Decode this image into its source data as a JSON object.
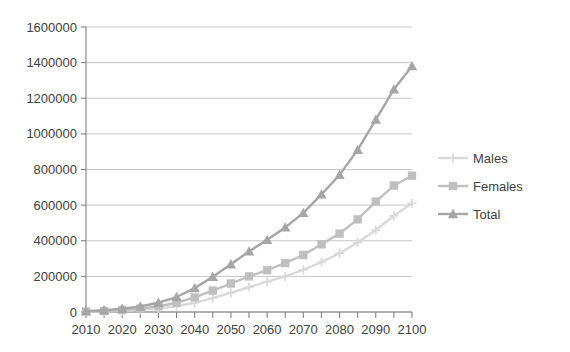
{
  "chart_data": {
    "type": "line",
    "title": "",
    "xlabel": "",
    "ylabel": "",
    "xlim": [
      2010,
      2100
    ],
    "ylim": [
      0,
      1600000
    ],
    "grid": true,
    "legend_position": "right",
    "y_ticks": [
      0,
      200000,
      400000,
      600000,
      800000,
      1000000,
      1200000,
      1400000,
      1600000
    ],
    "y_tick_labels": [
      "0",
      "200000",
      "400000",
      "600000",
      "800000",
      "1000000",
      "1200000",
      "1400000",
      "1600000"
    ],
    "x_ticks": [
      2010,
      2020,
      2030,
      2040,
      2050,
      2060,
      2070,
      2080,
      2090,
      2100
    ],
    "x_tick_labels": [
      "2010",
      "2020",
      "2030",
      "2040",
      "2050",
      "2060",
      "2070",
      "2080",
      "2090",
      "2100"
    ],
    "x_minor_ticks": [
      2015,
      2025,
      2035,
      2045,
      2055,
      2065,
      2075,
      2085,
      2095
    ],
    "x": [
      2010,
      2015,
      2020,
      2025,
      2030,
      2035,
      2040,
      2045,
      2050,
      2055,
      2060,
      2065,
      2070,
      2075,
      2080,
      2085,
      2090,
      2095,
      2100
    ],
    "series": [
      {
        "name": "Males",
        "color": "#d9d9d9",
        "marker": "cross",
        "values": [
          2000,
          4000,
          7000,
          12000,
          20000,
          32000,
          52000,
          78000,
          108000,
          140000,
          170000,
          200000,
          236000,
          280000,
          330000,
          390000,
          460000,
          540000,
          610000
        ]
      },
      {
        "name": "Females",
        "color": "#bfbfbf",
        "marker": "square",
        "values": [
          3000,
          6000,
          11000,
          19000,
          32000,
          52000,
          82000,
          120000,
          160000,
          200000,
          235000,
          275000,
          320000,
          380000,
          440000,
          520000,
          620000,
          710000,
          765000
        ]
      },
      {
        "name": "Total",
        "color": "#a6a6a6",
        "marker": "triangle",
        "values": [
          5000,
          10000,
          18000,
          31000,
          52000,
          84000,
          134000,
          198000,
          268000,
          340000,
          405000,
          475000,
          556000,
          660000,
          770000,
          910000,
          1080000,
          1250000,
          1380000
        ]
      }
    ]
  },
  "legend": {
    "items": [
      {
        "label": "Males"
      },
      {
        "label": "Females"
      },
      {
        "label": "Total"
      }
    ]
  }
}
